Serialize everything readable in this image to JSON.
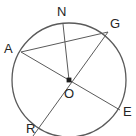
{
  "figure": {
    "kind": "circle-geometry-diagram",
    "width": 136,
    "height": 136,
    "background_color": "#ffffff",
    "stroke_color": "#555555",
    "label_color": "#252525"
  },
  "circle": {
    "name": "circle-O",
    "center_label": "O",
    "center_x": 69,
    "center_y": 80,
    "radius": 57
  },
  "center_point": {
    "label": "O",
    "x": 69,
    "y": 80,
    "label_x": 64,
    "label_y": 87
  },
  "points": [
    {
      "label": "A",
      "x": 21,
      "y": 52,
      "label_x": 4,
      "label_y": 42
    },
    {
      "label": "N",
      "x": 63,
      "y": 24,
      "label_x": 57,
      "label_y": 5
    },
    {
      "label": "G",
      "x": 108,
      "y": 32,
      "label_x": 110,
      "label_y": 17
    },
    {
      "label": "E",
      "x": 120,
      "y": 110,
      "label_x": 122,
      "label_y": 105
    },
    {
      "label": "R",
      "x": 40,
      "y": 130,
      "label_x": 26,
      "label_y": 122
    }
  ],
  "segments": [
    {
      "name": "diameter-A-E",
      "from": "A",
      "to": "E",
      "x1": 21,
      "y1": 52,
      "x2": 120,
      "y2": 110
    },
    {
      "name": "diameter-G-R",
      "from": "G",
      "to": "R",
      "x1": 108,
      "y1": 32,
      "x2": 34,
      "y2": 136
    },
    {
      "name": "chord-A-G",
      "from": "A",
      "to": "G",
      "x1": 21,
      "y1": 52,
      "x2": 108,
      "y2": 32
    },
    {
      "name": "radius-N-O",
      "from": "N",
      "to": "O",
      "x1": 63,
      "y1": 24,
      "x2": 69,
      "y2": 80
    }
  ],
  "labels": {
    "a": "A",
    "n": "N",
    "g": "G",
    "e": "E",
    "r": "R",
    "o": "O"
  }
}
